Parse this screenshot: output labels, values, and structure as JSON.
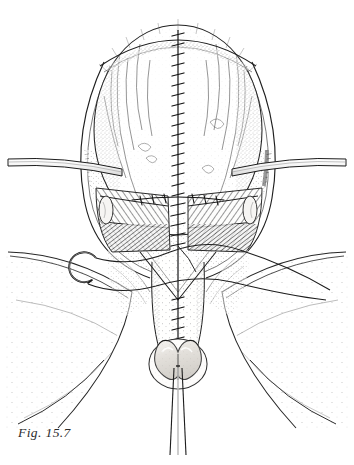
{
  "figure": {
    "caption": "Fig. 15.7",
    "caption_position": "bottom-left",
    "medium": "pen-and-ink stipple and line-hatch medical illustration",
    "background_color": "#ffffff",
    "ink_color": "#1a1a1a",
    "stipple_color": "#4a4a4a",
    "hatch_color": "#5a5a5a",
    "highlight_fill": "#e8e6e2",
    "tissue_fill": "#fbfbfa"
  },
  "anatomy": {
    "dome": {
      "name": "upper-organ-dome",
      "cx": 178,
      "cy": 130,
      "rx": 84,
      "ry": 105,
      "description": "large oval organ mass with stippled surface and vascular tracery"
    },
    "midline_suture": {
      "name": "midline-suture-line",
      "x": 178,
      "y_top": 30,
      "y_bottom": 350,
      "stitch_count": 34,
      "stitch_width": 11,
      "description": "continuous vertical closure with transverse cross-stitches"
    },
    "muscle_left": {
      "name": "left-muscle-belly",
      "cx": 128,
      "cy": 215,
      "hatch_direction": "radial-fan",
      "description": "dark hatched muscle flap left of midline"
    },
    "muscle_right": {
      "name": "right-muscle-belly",
      "cx": 228,
      "cy": 215,
      "hatch_direction": "radial-fan",
      "description": "dark hatched muscle flap right of midline"
    },
    "nodule_left": {
      "name": "left-oval-nodule",
      "cx": 106,
      "cy": 210,
      "rx": 7,
      "ry": 14
    },
    "nodule_right": {
      "name": "right-oval-nodule",
      "cx": 250,
      "cy": 210,
      "rx": 7,
      "ry": 14
    },
    "lower_shaft": {
      "name": "lower-midline-shaft",
      "cx": 178,
      "cy": 320,
      "description": "tapering stippled column below the muscle layer"
    },
    "terminal_structure": {
      "name": "terminal-horseshoe-structure",
      "cx": 178,
      "cy": 363,
      "rx": 28,
      "ry": 24,
      "fill": "#dedbd6",
      "description": "heart/horseshoe shaped terminal mass with highlight"
    },
    "flap_left": {
      "name": "left-skin-flap",
      "description": "stippled curved skin flap sweeping to lower left"
    },
    "flap_right": {
      "name": "right-skin-flap",
      "description": "stippled curved skin flap sweeping to lower right"
    }
  },
  "instruments": {
    "retractor_left": {
      "name": "left-retractor-bar",
      "x1": 10,
      "y1": 160,
      "x2": 122,
      "y2": 170,
      "description": "horizontal double-line metal retractor blade entering from left margin"
    },
    "retractor_right": {
      "name": "right-retractor-bar",
      "x1": 236,
      "y1": 170,
      "x2": 344,
      "y2": 160,
      "description": "horizontal double-line metal retractor blade entering from right margin"
    },
    "needle": {
      "name": "curved-suture-needle",
      "cx": 82,
      "cy": 268,
      "r": 14,
      "description": "curved surgical needle at left of field"
    },
    "suture_thread_upper": {
      "name": "suture-thread-upper",
      "description": "thread running from needle across midline and off the right margin"
    },
    "suture_thread_lower": {
      "name": "suture-thread-lower",
      "description": "second thread sweeping from lower left to right margin"
    },
    "catheter": {
      "name": "drainage-catheter",
      "x": 178,
      "y_top": 366,
      "y_bottom": 455,
      "description": "straight двойной-line tube exiting the terminal structure downward"
    }
  },
  "labels": {
    "items": []
  }
}
